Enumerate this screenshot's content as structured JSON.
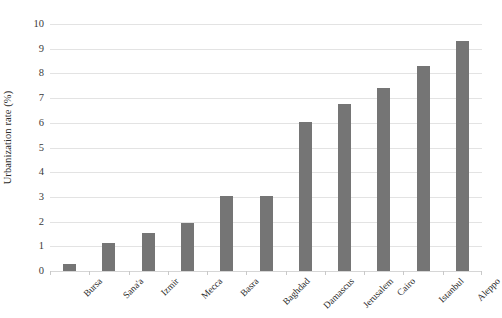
{
  "chart_data": {
    "type": "bar",
    "title": "",
    "subtitle": "",
    "xlabel": "",
    "ylabel": "Urbanization rate (%)",
    "ylim": [
      0,
      10
    ],
    "ytick_step": 1,
    "ytick_labels": [
      "0",
      "1",
      "2",
      "3",
      "4",
      "5",
      "6",
      "7",
      "8",
      "9",
      "10"
    ],
    "grid": true,
    "legend": false,
    "legend_position": "none",
    "orientation": "vertical",
    "bar_color": "#757575",
    "gridline_color": "#e3e3e3",
    "categories": [
      "Bursa",
      "Sana'a",
      "Izmir",
      "Mecca",
      "Basra",
      "Baghdad",
      "Damascus",
      "Jerusalem",
      "Cairo",
      "Istanbul",
      "Aleppo"
    ],
    "values": [
      0.3,
      1.15,
      1.55,
      1.95,
      3.05,
      3.05,
      6.05,
      6.75,
      7.4,
      8.3,
      9.3
    ],
    "series": [
      {
        "name": "Urbanization rate (%)",
        "values": [
          0.3,
          1.15,
          1.55,
          1.95,
          3.05,
          3.05,
          6.05,
          6.75,
          7.4,
          8.3,
          9.3
        ]
      }
    ]
  }
}
